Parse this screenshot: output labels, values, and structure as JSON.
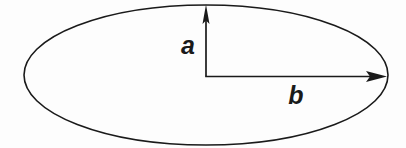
{
  "figure": {
    "type": "geometry-diagram",
    "background_color": "#fdfdfd",
    "stroke_color": "#1a1a1a",
    "labels": {
      "semi_minor": "a",
      "semi_major": "b"
    },
    "shapes": {
      "ellipse": {
        "name": "ellipse-outline",
        "center_x": 206,
        "center_y": 75,
        "radius_x": 182,
        "radius_y": 70,
        "stroke_width": 1.6,
        "fill": "none"
      },
      "vertical_arrow": {
        "name": "semi-minor-axis-arrow",
        "from_x": 206,
        "from_y": 76,
        "to_x": 206,
        "to_y": 5,
        "stroke_width": 1.6,
        "head_width": 7,
        "head_length": 19
      },
      "horizontal_arrow": {
        "name": "semi-major-axis-arrow",
        "from_x": 206,
        "from_y": 76,
        "to_x": 387,
        "to_y": 76,
        "stroke_width": 1.6,
        "head_width": 11,
        "head_length": 21
      }
    },
    "label_positions": {
      "semi_minor": {
        "x": 188,
        "y": 54
      },
      "semi_major": {
        "x": 296,
        "y": 104
      }
    }
  }
}
